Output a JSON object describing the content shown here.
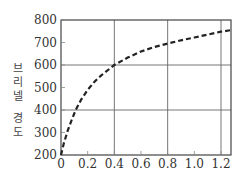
{
  "chart_data": {
    "type": "line",
    "title": "",
    "xlabel": "",
    "ylabel": "브리넬 경도",
    "ylabel_chars": [
      "브",
      "리",
      "넬",
      "",
      "경",
      "도"
    ],
    "xlim": [
      0,
      1.275
    ],
    "ylim": [
      200,
      800
    ],
    "x_ticks": [
      "0",
      "0.2",
      "0.4",
      "0.6",
      "0.8",
      "1.0",
      "1.2"
    ],
    "x_tick_values": [
      0,
      0.2,
      0.4,
      0.6,
      0.8,
      1.0,
      1.2
    ],
    "y_ticks": [
      "200",
      "300",
      "400",
      "500",
      "600",
      "700",
      "800"
    ],
    "y_tick_values": [
      200,
      300,
      400,
      500,
      600,
      700,
      800
    ],
    "grid": {
      "x": [
        0.4,
        0.8,
        1.2
      ],
      "y": [
        400,
        600
      ]
    },
    "legend": null,
    "series": [
      {
        "name": "Brinell hardness",
        "style": "dashed",
        "color": "#222222",
        "x": [
          0,
          0.02,
          0.05,
          0.08,
          0.11,
          0.15,
          0.2,
          0.25,
          0.3,
          0.4,
          0.5,
          0.6,
          0.7,
          0.8,
          0.9,
          1.0,
          1.1,
          1.2,
          1.275
        ],
        "y": [
          200,
          250,
          308,
          356,
          400,
          445,
          490,
          525,
          553,
          600,
          633,
          660,
          680,
          695,
          710,
          722,
          735,
          748,
          755
        ]
      }
    ]
  }
}
